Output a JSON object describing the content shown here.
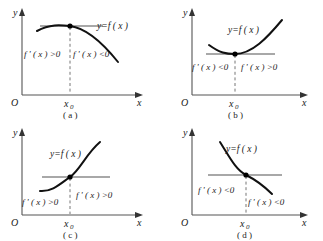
{
  "figure": {
    "panels": [
      {
        "id": "a",
        "caption": "( a )",
        "axis": {
          "y_label": "y",
          "x_label": "x",
          "origin_label": "O",
          "x0_label": "x",
          "x0_subscript": "0"
        },
        "curve_label": "y=f ( x )",
        "left_derivative": "f ' ( x ) >0",
        "right_derivative": "f ' ( x ) <0",
        "shape": "concave-down-maximum",
        "description": "Curve rises to a maximum at x0 then falls; horizontal tangent at the marked point."
      },
      {
        "id": "b",
        "caption": "( b )",
        "axis": {
          "y_label": "y",
          "x_label": "x",
          "origin_label": "O",
          "x0_label": "x",
          "x0_subscript": "0"
        },
        "curve_label": "y=f ( x )",
        "left_derivative": "f ' ( x ) <0",
        "right_derivative": "f ' ( x ) >0",
        "shape": "concave-up-minimum",
        "description": "Curve falls to a minimum at x0 then rises; horizontal tangent at the marked point."
      },
      {
        "id": "c",
        "caption": "( c )",
        "axis": {
          "y_label": "y",
          "x_label": "x",
          "origin_label": "O",
          "x0_label": "x",
          "x0_subscript": "0"
        },
        "curve_label": "y=f ( x )",
        "left_derivative": "f ' ( x ) >0",
        "right_derivative": "f ' ( x ) >0",
        "shape": "increasing-inflection",
        "description": "Increasing S-shaped curve with horizontal tangent at the inflection point x0."
      },
      {
        "id": "d",
        "caption": "( d )",
        "axis": {
          "y_label": "y",
          "x_label": "x",
          "origin_label": "O",
          "x0_label": "x",
          "x0_subscript": "0"
        },
        "curve_label": "y=f ( x )",
        "left_derivative": "f ' ( x ) <0",
        "right_derivative": "f ' ( x ) <0",
        "shape": "decreasing-inflection",
        "description": "Decreasing S-shaped curve with horizontal tangent at the inflection point x0."
      }
    ]
  },
  "colors": {
    "background": "#ffffff",
    "curve": "#111111",
    "tangent": "#a8a8a8",
    "axis": "#555555",
    "dashed": "#777777",
    "text": "#1a1a1a"
  }
}
